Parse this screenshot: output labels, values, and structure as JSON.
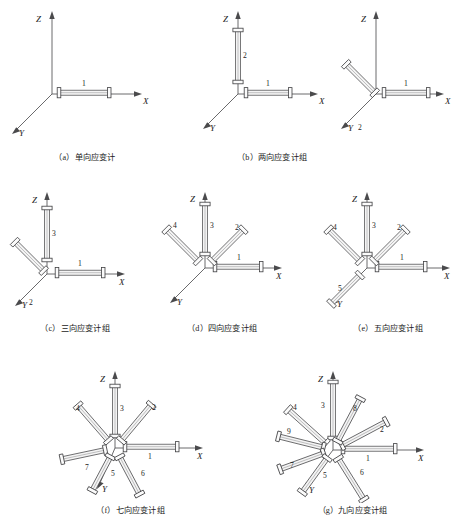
{
  "figure": {
    "axis_labels": {
      "x": "X",
      "y": "Y",
      "z": "Z"
    },
    "colors": {
      "line": "#59595b",
      "gauge_fill": "#f4f4f4",
      "gauge_stroke": "#4d4d4f",
      "text": "#1d1d1d",
      "background": "#ffffff"
    }
  },
  "panels": [
    {
      "id": "a",
      "caption": "（a）单向应变计",
      "gauge_count": 1,
      "gauge_labels": [
        "1"
      ]
    },
    {
      "id": "b",
      "caption": "（b）两向应变计组",
      "gauge_count": 2,
      "gauge_labels": [
        "1",
        "2"
      ]
    },
    {
      "id": "b2",
      "caption": "",
      "gauge_count": 2,
      "gauge_labels": [
        "1",
        "2"
      ]
    },
    {
      "id": "c",
      "caption": "（c）三向应变计组",
      "gauge_count": 3,
      "gauge_labels": [
        "1",
        "2",
        "3"
      ]
    },
    {
      "id": "d",
      "caption": "（d）四向应变计组",
      "gauge_count": 4,
      "gauge_labels": [
        "1",
        "2",
        "3",
        "4"
      ]
    },
    {
      "id": "e",
      "caption": "（e）五向应变计组",
      "gauge_count": 5,
      "gauge_labels": [
        "1",
        "2",
        "3",
        "4",
        "5"
      ]
    },
    {
      "id": "f",
      "caption": "（f）七向应变计组",
      "gauge_count": 7,
      "gauge_labels": [
        "1",
        "2",
        "3",
        "4",
        "5",
        "6",
        "7"
      ]
    },
    {
      "id": "g",
      "caption": "（g）九向应变计组",
      "gauge_count": 9,
      "gauge_labels": [
        "1",
        "2",
        "3",
        "4",
        "5",
        "6",
        "7",
        "8",
        "9"
      ]
    }
  ]
}
